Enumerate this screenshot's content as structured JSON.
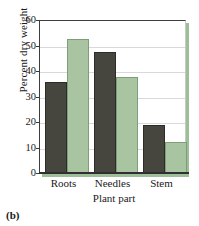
{
  "caption": "(b)",
  "chart_data": {
    "type": "bar",
    "title": "",
    "subtitle": "",
    "xlabel": "Plant part",
    "ylabel": "Percent dry weight",
    "categories": [
      "Roots",
      "Needles",
      "Stem"
    ],
    "series": [
      {
        "name": "series-1",
        "color": "#46463f",
        "values": [
          35.5,
          47.5,
          19
        ]
      },
      {
        "name": "series-2",
        "color": "#a9c4a1",
        "values": [
          52.5,
          37.5,
          12
        ]
      }
    ],
    "ylim": [
      0,
      60
    ],
    "ytick_labels": [
      "0",
      "10",
      "20",
      "30",
      "40",
      "50",
      "60"
    ],
    "ytick_values": [
      0,
      10,
      20,
      30,
      40,
      50,
      60
    ],
    "grid": true,
    "legend": "none",
    "frame_shadow_color": "#9ebd99",
    "axis_color": "#2f2f2f",
    "gridline_color": "#d9d9d9",
    "background": "#ffffff"
  }
}
